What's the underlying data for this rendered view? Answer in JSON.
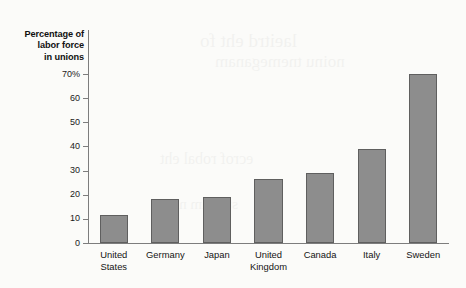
{
  "chart_data": {
    "type": "bar",
    "title": "",
    "ylabel": "Percentage of labor force in unions",
    "ylabel_lines": [
      "Percentage of",
      "labor force",
      "in unions"
    ],
    "xlabel": "",
    "categories": [
      "United States",
      "Germany",
      "Japan",
      "United Kingdom",
      "Canada",
      "Italy",
      "Sweden"
    ],
    "category_lines": [
      [
        "United",
        "States"
      ],
      [
        "Germany"
      ],
      [
        "Japan"
      ],
      [
        "United",
        "Kingdom"
      ],
      [
        "Canada"
      ],
      [
        "Italy"
      ],
      [
        "Sweden"
      ]
    ],
    "values": [
      11,
      18,
      18.5,
      26,
      28.5,
      38.5,
      69.5
    ],
    "ylim": [
      0,
      74
    ],
    "yticks": [
      0,
      10,
      20,
      30,
      40,
      50,
      60,
      70
    ],
    "ytick_labels": [
      "0",
      "10",
      "20",
      "30",
      "40",
      "50",
      "60",
      "70%"
    ],
    "grid": false,
    "legend": "none",
    "bar_color": "#8d8d8d",
    "bar_edge_color": "#5f5f5f",
    "axis_color": "#7d7d7d",
    "background_color": "#fbfbf9"
  },
  "bleed_text": {
    "line1": "laeitrd eht fo",
    "line2": "noinu tnemeganam",
    "line3": "ecrof robal eht",
    "line4": "stekram ni"
  }
}
